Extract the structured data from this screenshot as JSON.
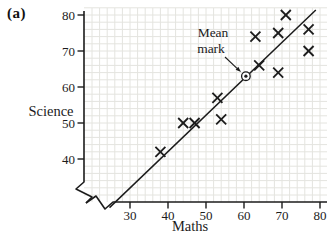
{
  "panel_label": "(a)",
  "colors": {
    "ink": "#1c1c1c",
    "grid": "#e4e4df",
    "background": "#ffffff"
  },
  "annotation": {
    "label_line1": "Mean",
    "label_line2": "mark"
  },
  "chart_data": {
    "type": "scatter",
    "title": "",
    "xlabel": "Maths",
    "ylabel": "Science",
    "x_ticks": [
      30,
      40,
      50,
      60,
      70,
      80
    ],
    "y_ticks": [
      40,
      50,
      60,
      70,
      80
    ],
    "xlim": [
      24,
      81
    ],
    "ylim": [
      28,
      81
    ],
    "axis_break_at_origin": true,
    "grid": "on",
    "grid_step": 2,
    "marker": "x",
    "points": [
      [
        38,
        42
      ],
      [
        44,
        50
      ],
      [
        47,
        50
      ],
      [
        53,
        57
      ],
      [
        54,
        51
      ],
      [
        63,
        74
      ],
      [
        64,
        66
      ],
      [
        69,
        75
      ],
      [
        69,
        64
      ],
      [
        71,
        80
      ],
      [
        77,
        76
      ],
      [
        77,
        70
      ]
    ],
    "mean_point": {
      "x": 60.5,
      "y": 63,
      "label": "Mean mark"
    },
    "best_fit_line": {
      "x1": 24.6,
      "y1": 26.5,
      "x2": 78.9,
      "y2": 81.4
    }
  }
}
